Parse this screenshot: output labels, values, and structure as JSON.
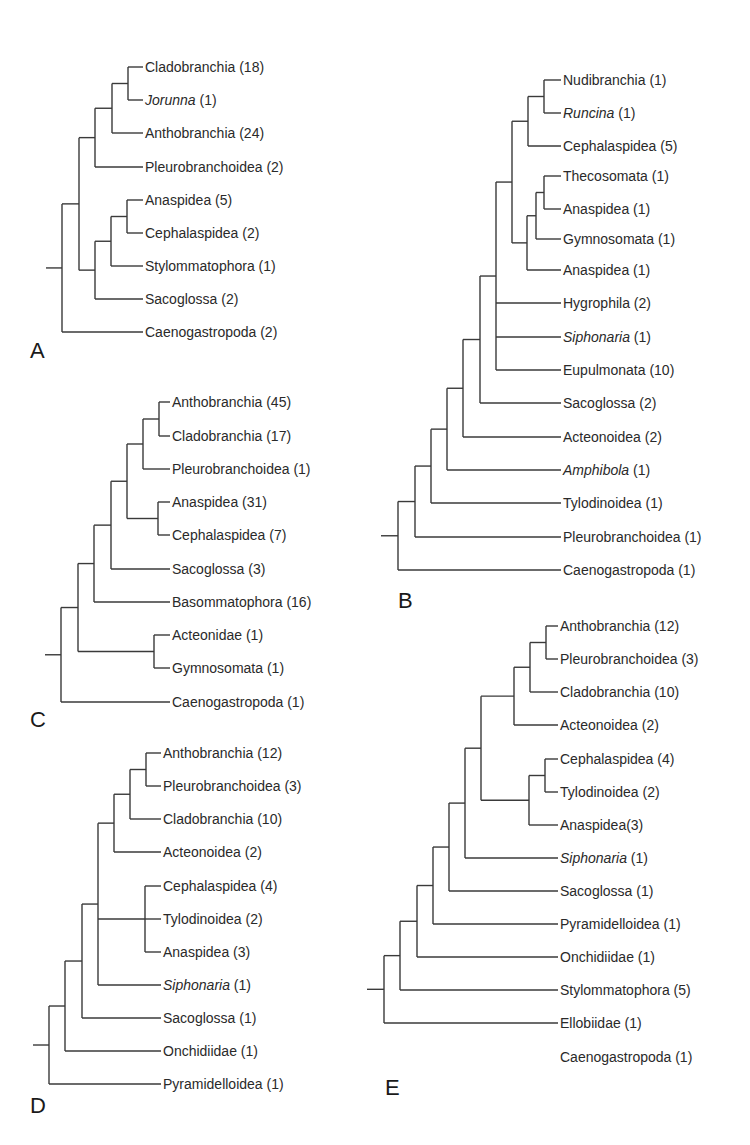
{
  "figure": {
    "type": "phylogenetic-trees",
    "panels": [
      {
        "id": "A",
        "letter": "A",
        "letter_pos": [
          30,
          358
        ],
        "leaf_x": 145,
        "root_stub_x": 46,
        "leaves": [
          {
            "name": "Cladobranchia",
            "italic": false,
            "count": "(18)",
            "y": 67
          },
          {
            "name": "Jorunna",
            "italic": true,
            "count": "(1)",
            "y": 100
          },
          {
            "name": "Anthobranchia",
            "italic": false,
            "count": "(24)",
            "y": 133
          },
          {
            "name": "Pleurobranchoidea",
            "italic": false,
            "count": "(2)",
            "y": 167
          },
          {
            "name": "Anaspidea",
            "italic": false,
            "count": "(5)",
            "y": 200
          },
          {
            "name": "Cephalaspidea",
            "italic": false,
            "count": " (2)",
            "y": 233
          },
          {
            "name": "Stylommatophora",
            "italic": false,
            "count": "(1)",
            "y": 266
          },
          {
            "name": "Sacoglossa",
            "italic": false,
            "count": "(2)",
            "y": 299
          },
          {
            "name": "Caenogastropoda",
            "italic": false,
            "count": "(2)",
            "y": 332
          }
        ],
        "tree": {
          "x": 62,
          "c": [
            {
              "x": 79,
              "c": [
                {
                  "x": 95,
                  "c": [
                    {
                      "x": 112,
                      "c": [
                        {
                          "x": 128,
                          "c": [
                            0,
                            1
                          ]
                        },
                        2
                      ]
                    },
                    3
                  ]
                },
                {
                  "x": 95,
                  "c": [
                    {
                      "x": 111,
                      "c": [
                        {
                          "x": 127,
                          "c": [
                            4,
                            5
                          ]
                        },
                        6
                      ]
                    },
                    7
                  ]
                }
              ]
            },
            8
          ]
        }
      },
      {
        "id": "B",
        "letter": "B",
        "letter_pos": [
          398,
          608
        ],
        "leaf_x": 563,
        "root_stub_x": 381,
        "leaves": [
          {
            "name": "Nudibranchia",
            "italic": false,
            "count": "(1)",
            "y": 80
          },
          {
            "name": "Runcina",
            "italic": true,
            "count": "(1)",
            "y": 113
          },
          {
            "name": "Cephalaspidea",
            "italic": false,
            "count": "(5)",
            "y": 146
          },
          {
            "name": "Thecosomata",
            "italic": false,
            "count": "(1)",
            "y": 176
          },
          {
            "name": "Anaspidea",
            "italic": false,
            "count": "(1)",
            "y": 209
          },
          {
            "name": "Gymnosomata",
            "italic": false,
            "count": "(1)",
            "y": 239
          },
          {
            "name": "Anaspidea",
            "italic": false,
            "count": "(1)",
            "y": 270
          },
          {
            "name": "Hygrophila",
            "italic": false,
            "count": "(2)",
            "y": 303
          },
          {
            "name": "Siphonaria",
            "italic": true,
            "count": "(1)",
            "y": 337
          },
          {
            "name": "Eupulmonata",
            "italic": false,
            "count": "(10)",
            "y": 370
          },
          {
            "name": "Sacoglossa",
            "italic": false,
            "count": "(2)",
            "y": 403
          },
          {
            "name": "Acteonoidea",
            "italic": false,
            "count": "(2)",
            "y": 437
          },
          {
            "name": "Amphibola",
            "italic": true,
            "count": "(1)",
            "y": 470
          },
          {
            "name": "Tylodinoidea",
            "italic": false,
            "count": "(1)",
            "y": 503
          },
          {
            "name": "Pleurobranchoidea",
            "italic": false,
            "count": "(1)",
            "y": 537
          },
          {
            "name": "Caenogastropoda",
            "italic": false,
            "count": "(1)",
            "y": 570
          }
        ],
        "tree": {
          "x": 398,
          "c": [
            {
              "x": 415,
              "c": [
                {
                  "x": 431,
                  "c": [
                    {
                      "x": 447,
                      "c": [
                        {
                          "x": 463,
                          "c": [
                            {
                              "x": 480,
                              "c": [
                                {
                                  "x": 496,
                                  "c": [
                                    {
                                      "x": 512,
                                      "c": [
                                        {
                                          "x": 528,
                                          "c": [
                                            {
                                              "x": 544,
                                              "c": [
                                                0,
                                                1
                                              ]
                                            },
                                            2
                                          ]
                                        },
                                        {
                                          "x": 527,
                                          "c": [
                                            {
                                              "x": 536,
                                              "c": [
                                                {
                                                  "x": 544,
                                                  "c": [
                                                    3,
                                                    4
                                                  ]
                                                },
                                                5
                                              ]
                                            },
                                            6
                                          ]
                                        }
                                      ]
                                    },
                                    7,
                                    8,
                                    9
                                  ]
                                },
                                10
                              ]
                            },
                            11
                          ]
                        },
                        12
                      ]
                    },
                    13
                  ]
                },
                14
              ]
            },
            15
          ]
        }
      },
      {
        "id": "C",
        "letter": "C",
        "letter_pos": [
          30,
          727
        ],
        "leaf_x": 172,
        "root_stub_x": 45,
        "leaves": [
          {
            "name": "Anthobranchia",
            "italic": false,
            "count": "(45)",
            "y": 402
          },
          {
            "name": "Cladobranchia",
            "italic": false,
            "count": "(17)",
            "y": 436
          },
          {
            "name": "Pleurobranchoidea",
            "italic": false,
            "count": "(1)",
            "y": 469
          },
          {
            "name": "Anaspidea",
            "italic": false,
            "count": "(31)",
            "y": 502
          },
          {
            "name": "Cephalaspidea",
            "italic": false,
            "count": "(7)",
            "y": 535
          },
          {
            "name": "Sacoglossa",
            "italic": false,
            "count": "(3)",
            "y": 569
          },
          {
            "name": "Basommatophora",
            "italic": false,
            "count": "(16)",
            "y": 602
          },
          {
            "name": "Acteonidae",
            "italic": false,
            "count": "(1)",
            "y": 635
          },
          {
            "name": "Gymnosomata",
            "italic": false,
            "count": "(1)",
            "y": 668
          },
          {
            "name": "Caenogastropoda",
            "italic": false,
            "count": "(1)",
            "y": 702
          }
        ],
        "tree": {
          "x": 61,
          "c": [
            {
              "x": 78,
              "c": [
                {
                  "x": 94,
                  "c": [
                    {
                      "x": 111,
                      "c": [
                        {
                          "x": 127,
                          "c": [
                            {
                              "x": 143,
                              "c": [
                                {
                                  "x": 159,
                                  "c": [
                                    0,
                                    1
                                  ]
                                },
                                2
                              ]
                            },
                            {
                              "x": 158,
                              "c": [
                                3,
                                4
                              ]
                            }
                          ]
                        },
                        5
                      ]
                    },
                    6
                  ]
                },
                {
                  "x": 154,
                  "c": [
                    7,
                    8
                  ]
                }
              ]
            },
            9
          ]
        }
      },
      {
        "id": "D",
        "letter": "D",
        "letter_pos": [
          30,
          1113
        ],
        "leaf_x": 163,
        "root_stub_x": 33,
        "leaves": [
          {
            "name": "Anthobranchia",
            "italic": false,
            "count": "(12)",
            "y": 753
          },
          {
            "name": "Pleurobranchoidea",
            "italic": false,
            "count": "(3)",
            "y": 786
          },
          {
            "name": "Cladobranchia",
            "italic": false,
            "count": "(10)",
            "y": 819
          },
          {
            "name": "Acteonoidea",
            "italic": false,
            "count": "(2)",
            "y": 852
          },
          {
            "name": "Cephalaspidea",
            "italic": false,
            "count": "(4)",
            "y": 886
          },
          {
            "name": "Tylodinoidea",
            "italic": false,
            "count": "(2)",
            "y": 919
          },
          {
            "name": "Anaspidea",
            "italic": false,
            "count": "(3)",
            "y": 952
          },
          {
            "name": "Siphonaria",
            "italic": true,
            "count": "(1)",
            "y": 985
          },
          {
            "name": "Sacoglossa",
            "italic": false,
            "count": "(1)",
            "y": 1018
          },
          {
            "name": "Onchidiidae",
            "italic": false,
            "count": "(1)",
            "y": 1051
          },
          {
            "name": "Pyramidelloidea",
            "italic": false,
            "count": "(1)",
            "y": 1084
          }
        ],
        "tree": {
          "x": 49,
          "c": [
            {
              "x": 65,
              "c": [
                {
                  "x": 82,
                  "c": [
                    {
                      "x": 98,
                      "c": [
                        {
                          "x": 114,
                          "c": [
                            {
                              "x": 130,
                              "c": [
                                {
                                  "x": 146,
                                  "c": [
                                    0,
                                    1
                                  ]
                                },
                                2
                              ]
                            },
                            3
                          ]
                        },
                        {
                          "x": 145,
                          "c": [
                            4,
                            5,
                            6
                          ]
                        },
                        7
                      ]
                    },
                    8
                  ]
                },
                9
              ]
            },
            10
          ]
        }
      },
      {
        "id": "E",
        "letter": "E",
        "letter_pos": [
          385,
          1095
        ],
        "leaf_x": 560,
        "root_stub_x": 367,
        "leaves": [
          {
            "name": "Anthobranchia",
            "italic": false,
            "count": "(12)",
            "y": 626
          },
          {
            "name": "Pleurobranchoidea",
            "italic": false,
            "count": "(3)",
            "y": 659
          },
          {
            "name": "Cladobranchia",
            "italic": false,
            "count": "(10)",
            "y": 692
          },
          {
            "name": "Acteonoidea",
            "italic": false,
            "count": "(2)",
            "y": 725
          },
          {
            "name": "Cephalaspidea",
            "italic": false,
            "count": " (4)",
            "y": 759
          },
          {
            "name": "Tylodinoidea",
            "italic": false,
            "count": "(2)",
            "y": 792
          },
          {
            "name": "Anaspidea",
            "italic": false,
            "count": "(3)",
            "y": 825,
            "nospace": true
          },
          {
            "name": "Siphonaria",
            "italic": true,
            "count": "(1)",
            "y": 858
          },
          {
            "name": "Sacoglossa",
            "italic": false,
            "count": "(1)",
            "y": 891
          },
          {
            "name": "Pyramidelloidea",
            "italic": false,
            "count": "(1)",
            "y": 924
          },
          {
            "name": "Onchidiidae",
            "italic": false,
            "count": "(1)",
            "y": 957
          },
          {
            "name": "Stylommatophora",
            "italic": false,
            "count": "(5)",
            "y": 990
          },
          {
            "name": "Ellobiidae",
            "italic": false,
            "count": "(1)",
            "y": 1023
          },
          {
            "name": "Caenogastropoda",
            "italic": false,
            "count": "(1)",
            "y": 1057
          }
        ],
        "tree": {
          "x": 384,
          "c": [
            {
              "x": 400,
              "c": [
                {
                  "x": 417,
                  "c": [
                    {
                      "x": 433,
                      "c": [
                        {
                          "x": 449,
                          "c": [
                            {
                              "x": 465,
                              "c": [
                                {
                                  "x": 481,
                                  "c": [
                                    {
                                      "x": 514,
                                      "c": [
                                        {
                                          "x": 530,
                                          "c": [
                                            {
                                              "x": 546,
                                              "c": [
                                                0,
                                                1
                                              ]
                                            },
                                            2
                                          ]
                                        },
                                        3
                                      ]
                                    },
                                    {
                                      "x": 529,
                                      "c": [
                                        {
                                          "x": 545,
                                          "c": [
                                            4,
                                            5
                                          ]
                                        },
                                        6
                                      ]
                                    }
                                  ]
                                },
                                7
                              ]
                            },
                            8
                          ]
                        },
                        9
                      ]
                    },
                    10
                  ]
                },
                11
              ]
            },
            12
          ]
        }
      }
    ]
  }
}
